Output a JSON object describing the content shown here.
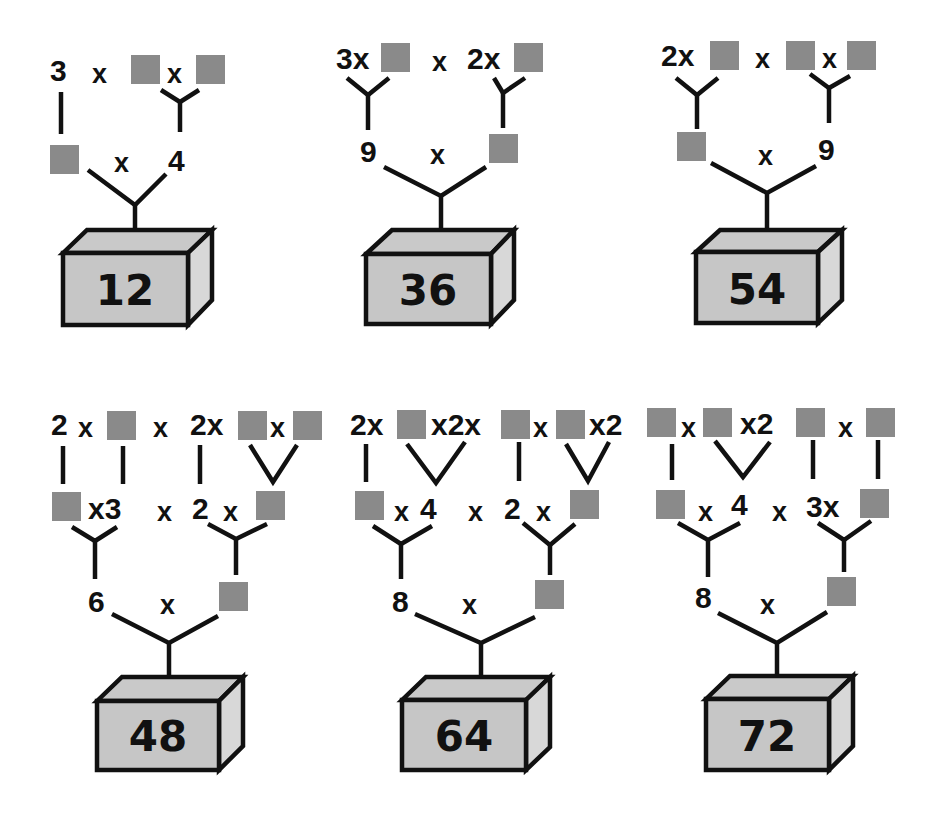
{
  "colors": {
    "blank_square": "#8a8a8a",
    "box_fill": "#c8c8c8",
    "box_side": "#d6d6d6",
    "line": "#111111"
  },
  "puzzles": [
    {
      "product": "12",
      "row1": [
        "3",
        "x",
        "■",
        "x",
        "■"
      ],
      "row2": [
        "■",
        "x",
        "4"
      ],
      "t": {
        "a": "3",
        "x1": "x",
        "x2": "x",
        "x3": "x",
        "b": "4"
      }
    },
    {
      "product": "36",
      "row1": [
        "3x",
        "■",
        "x",
        "2x",
        "■"
      ],
      "row2": [
        "9",
        "x",
        "■"
      ],
      "t": {
        "a": "3x",
        "x1": "x",
        "b": "2x",
        "x2": "x",
        "c": "9"
      }
    },
    {
      "product": "54",
      "row1": [
        "2x",
        "■",
        "x",
        "■",
        "x",
        "■"
      ],
      "row2": [
        "■",
        "x",
        "9"
      ],
      "t": {
        "a": "2x",
        "x1": "x",
        "x2": "x",
        "x3": "x",
        "c": "9"
      }
    },
    {
      "product": "48",
      "row1": [
        "2",
        "x",
        "■",
        "x",
        "2",
        "x",
        "■",
        "x",
        "■"
      ],
      "row2": [
        "■",
        "x",
        "3",
        "x",
        "2",
        "x",
        "■"
      ],
      "row3": [
        "6",
        "x",
        "■"
      ],
      "t": {
        "a": "2",
        "x1": "x",
        "x2": "x",
        "b": "2x",
        "x3": "x",
        "r2x1": "x3",
        "r2x2": "x",
        "r2b": "2",
        "r2x3": "x",
        "c": "6",
        "x4": "x"
      }
    },
    {
      "product": "64",
      "row1": [
        "2x",
        "■",
        "x",
        "2x",
        "■",
        "x",
        "■",
        "x2"
      ],
      "row2": [
        "■",
        "x",
        "4",
        "x",
        "2",
        "x",
        "■"
      ],
      "row3": [
        "8",
        "x",
        "■"
      ],
      "t": {
        "a": "2x",
        "b": "x2x",
        "x1": "x",
        "c": "x2",
        "r2x1": "x",
        "r2a": "4",
        "r2x2": "x",
        "r2b": "2",
        "r2x3": "x",
        "d": "8",
        "x4": "x"
      }
    },
    {
      "product": "72",
      "row1": [
        "■",
        "x",
        "■",
        "x",
        "2",
        "■",
        "x",
        "■"
      ],
      "row2": [
        "■",
        "x",
        "4",
        "x",
        "3",
        "x",
        "■"
      ],
      "row3": [
        "8",
        "x",
        "■"
      ],
      "t": {
        "x1": "x",
        "b": "x2",
        "x2": "x",
        "r2x1": "x",
        "r2a": "4",
        "r2x2": "x",
        "r2b": "3x",
        "d": "8",
        "x4": "x"
      }
    }
  ]
}
